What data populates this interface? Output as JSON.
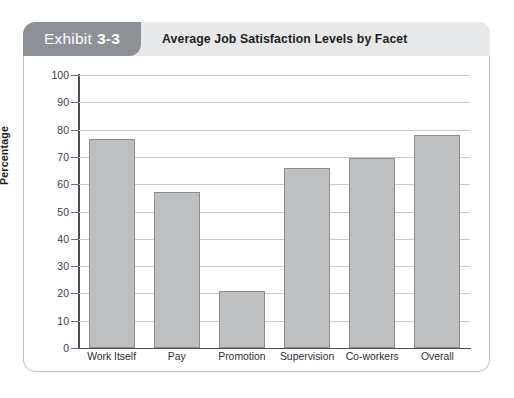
{
  "exhibit": {
    "tab_word": "Exhibit",
    "tab_number": "3-3",
    "title": "Average Job Satisfaction Levels by Facet"
  },
  "colors": {
    "tab_background": "#8d9195",
    "header_background": "#e7e8ea",
    "bar_fill": "#bdbfc1",
    "bar_border": "#8a8d90",
    "gridline": "#c9cbcd",
    "axis": "#4c4f52",
    "card_border": "#b9bcbe"
  },
  "chart_data": {
    "type": "bar",
    "title": "Average Job Satisfaction Levels by Facet",
    "xlabel": "",
    "ylabel": "Percentage",
    "categories": [
      "Work Itself",
      "Pay",
      "Promotion",
      "Supervision",
      "Co-workers",
      "Overall"
    ],
    "values": [
      76.5,
      57,
      21,
      66,
      69.5,
      78
    ],
    "ylim": [
      0,
      100
    ],
    "yticks": [
      0,
      10,
      20,
      30,
      40,
      50,
      60,
      70,
      80,
      90,
      100
    ],
    "ytick_labels": [
      "0",
      "10",
      "20",
      "30",
      "40",
      "50",
      "60",
      "70",
      "80",
      "90",
      "100"
    ],
    "grid": true,
    "grid_axis": "y",
    "legend": false,
    "series": [
      {
        "name": "Average Job Satisfaction",
        "values": [
          76.5,
          57,
          21,
          66,
          69.5,
          78
        ]
      }
    ]
  }
}
